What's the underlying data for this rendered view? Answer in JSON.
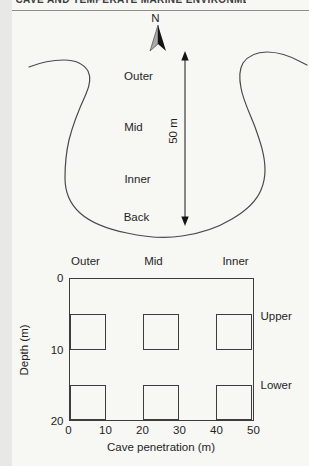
{
  "header": {
    "clipped_text": "CAVE AND TEMPERATE MARINE ENVIRONMENTS"
  },
  "map": {
    "north_label": "N",
    "zone_labels": [
      "Outer",
      "Mid",
      "Inner",
      "Back"
    ],
    "scale_label": "50 m"
  },
  "chart_data": {
    "type": "heatmap",
    "title": "",
    "xlabel": "Cave penetration (m)",
    "ylabel": "Depth (m)",
    "xlim": [
      0,
      50
    ],
    "ylim": [
      0,
      20
    ],
    "y_direction": "down",
    "xticks": [
      0,
      10,
      20,
      30,
      40,
      50
    ],
    "yticks": [
      0,
      10,
      20
    ],
    "grid": false,
    "column_labels": [
      "Outer",
      "Mid",
      "Inner"
    ],
    "row_labels": [
      "Upper",
      "Lower"
    ],
    "boxes": [
      {
        "column": "Outer",
        "row": "Upper",
        "x": [
          0,
          10
        ],
        "depth": [
          5,
          10
        ]
      },
      {
        "column": "Mid",
        "row": "Upper",
        "x": [
          20,
          30
        ],
        "depth": [
          5,
          10
        ]
      },
      {
        "column": "Inner",
        "row": "Upper",
        "x": [
          40,
          50
        ],
        "depth": [
          5,
          10
        ]
      },
      {
        "column": "Outer",
        "row": "Lower",
        "x": [
          0,
          10
        ],
        "depth": [
          15,
          20
        ]
      },
      {
        "column": "Mid",
        "row": "Lower",
        "x": [
          20,
          30
        ],
        "depth": [
          15,
          20
        ]
      },
      {
        "column": "Inner",
        "row": "Lower",
        "x": [
          40,
          50
        ],
        "depth": [
          15,
          20
        ]
      }
    ],
    "colors": {
      "ink": "#3d3d3d",
      "background": "#f7f7f4"
    }
  }
}
